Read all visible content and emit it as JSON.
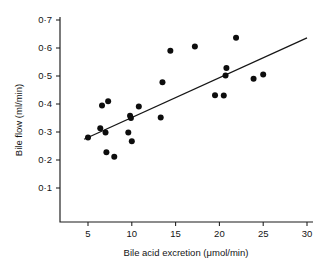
{
  "chart_data": {
    "type": "scatter",
    "title": "",
    "xlabel": "Bile acid excretion (μmol/min)",
    "ylabel": "Bile flow (ml/min)",
    "xlim": [
      0,
      30
    ],
    "ylim": [
      0,
      0.7
    ],
    "grid": false,
    "legend": null,
    "decimal_separator": "middle-dot",
    "x_ticks": [
      5,
      10,
      15,
      20,
      25,
      30
    ],
    "x_tick_labels": [
      "5",
      "10",
      "15",
      "20",
      "25",
      "30"
    ],
    "y_ticks": [
      0.1,
      0.2,
      0.3,
      0.4,
      0.5,
      0.6,
      0.7
    ],
    "y_tick_labels": [
      "0·1",
      "0·2",
      "0·3",
      "0·4",
      "0·5",
      "0·6",
      "0·7"
    ],
    "points": [
      {
        "x": 5.0,
        "y": 0.28
      },
      {
        "x": 6.4,
        "y": 0.313
      },
      {
        "x": 6.6,
        "y": 0.395
      },
      {
        "x": 7.0,
        "y": 0.298
      },
      {
        "x": 7.1,
        "y": 0.228
      },
      {
        "x": 7.3,
        "y": 0.41
      },
      {
        "x": 8.0,
        "y": 0.212
      },
      {
        "x": 9.6,
        "y": 0.298
      },
      {
        "x": 9.8,
        "y": 0.358
      },
      {
        "x": 9.9,
        "y": 0.35
      },
      {
        "x": 10.0,
        "y": 0.267
      },
      {
        "x": 10.8,
        "y": 0.391
      },
      {
        "x": 13.3,
        "y": 0.352
      },
      {
        "x": 13.5,
        "y": 0.478
      },
      {
        "x": 14.4,
        "y": 0.59
      },
      {
        "x": 17.2,
        "y": 0.605
      },
      {
        "x": 19.5,
        "y": 0.431
      },
      {
        "x": 20.5,
        "y": 0.43
      },
      {
        "x": 20.7,
        "y": 0.502
      },
      {
        "x": 20.8,
        "y": 0.529
      },
      {
        "x": 21.9,
        "y": 0.637
      },
      {
        "x": 23.9,
        "y": 0.49
      },
      {
        "x": 25.0,
        "y": 0.505
      }
    ],
    "fit_line": {
      "type": "linear-regression",
      "x_start": 4.55,
      "y_start": 0.274,
      "x_end": 30.0,
      "y_end": 0.636
    },
    "marker": {
      "shape": "circle",
      "color": "#0d0d0d",
      "radius_px": 3.0
    },
    "line_color": "#161616",
    "axis_color": "#1b1b1b",
    "background": "#ffffff"
  }
}
